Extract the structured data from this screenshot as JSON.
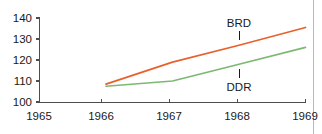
{
  "chart_data": {
    "type": "line",
    "title": "",
    "subtitle": "",
    "xlabel": "",
    "ylabel": "",
    "x": [
      1965,
      1966,
      1967,
      1968,
      1969
    ],
    "xticklabels": [
      "1965",
      "1966",
      "1967",
      "1968",
      "1969"
    ],
    "yticks": [
      100,
      110,
      120,
      130,
      140
    ],
    "yticklabels": [
      "100",
      "110",
      "120",
      "130",
      "140"
    ],
    "xlim": [
      1965,
      1969
    ],
    "ylim": [
      100,
      140
    ],
    "grid": false,
    "legend_position": "inline-annotations",
    "series": [
      {
        "name": "BRD",
        "color": "#e8602c",
        "x": [
          1966,
          1967,
          1968,
          1969
        ],
        "values": [
          108.5,
          119.0,
          127.0,
          135.5
        ]
      },
      {
        "name": "DDR",
        "color": "#7db872",
        "x": [
          1966,
          1967,
          1968,
          1969
        ],
        "values": [
          107.5,
          110.0,
          118.0,
          126.0
        ]
      }
    ],
    "annotations": [
      {
        "text": "BRD",
        "series": "BRD",
        "x": 1968,
        "y": 127.0
      },
      {
        "text": "DDR",
        "series": "DDR",
        "x": 1968,
        "y": 118.0
      }
    ]
  },
  "axis": {
    "y_tick_0": "100",
    "y_tick_1": "110",
    "y_tick_2": "120",
    "y_tick_3": "130",
    "y_tick_4": "140",
    "x_tick_0": "1965",
    "x_tick_1": "1966",
    "x_tick_2": "1967",
    "x_tick_3": "1968",
    "x_tick_4": "1969"
  },
  "labels": {
    "brd": "BRD",
    "ddr": "DDR"
  },
  "colors": {
    "brd_line": "#e8602c",
    "ddr_line": "#7db872",
    "axis": "#4d4d4d",
    "text": "#1a1a1a",
    "border": "#b9b9b9",
    "background": "#ffffff"
  }
}
